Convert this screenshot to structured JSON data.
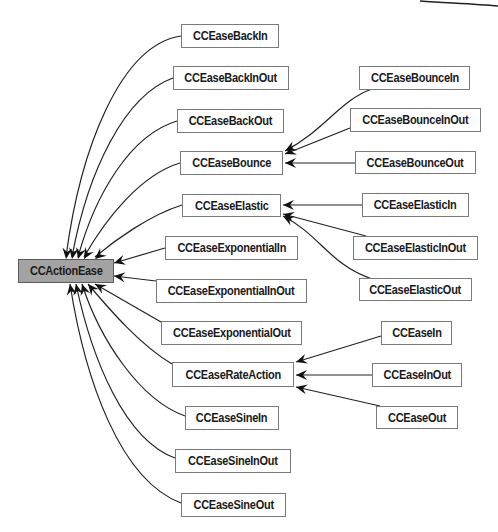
{
  "diagram": {
    "root": "CCActionEase",
    "colors": {
      "root_fill": "#a3a3a3",
      "node_fill": "#ffffff",
      "border": "#7a7a7a",
      "edge": "#222222"
    },
    "nodes": [
      {
        "id": "CCActionEase",
        "label": "CCActionEase",
        "x": 18,
        "y": 259,
        "w": 96,
        "h": 24,
        "root": true
      },
      {
        "id": "CCEaseBackIn",
        "label": "CCEaseBackIn",
        "x": 181,
        "y": 24,
        "w": 98,
        "h": 24
      },
      {
        "id": "CCEaseBackInOut",
        "label": "CCEaseBackInOut",
        "x": 173,
        "y": 66,
        "w": 116,
        "h": 24
      },
      {
        "id": "CCEaseBackOut",
        "label": "CCEaseBackOut",
        "x": 177,
        "y": 109,
        "w": 107,
        "h": 24
      },
      {
        "id": "CCEaseBounce",
        "label": "CCEaseBounce",
        "x": 180,
        "y": 151,
        "w": 103,
        "h": 24
      },
      {
        "id": "CCEaseElastic",
        "label": "CCEaseElastic",
        "x": 182,
        "y": 194,
        "w": 99,
        "h": 23
      },
      {
        "id": "CCEaseExponentialIn",
        "label": "CCEaseExponentialIn",
        "x": 165,
        "y": 236,
        "w": 133,
        "h": 24
      },
      {
        "id": "CCEaseExponentialInOut",
        "label": "CCEaseExponentialInOut",
        "x": 156,
        "y": 279,
        "w": 151,
        "h": 24
      },
      {
        "id": "CCEaseExponentialOut",
        "label": "CCEaseExponentialOut",
        "x": 161,
        "y": 321,
        "w": 141,
        "h": 24
      },
      {
        "id": "CCEaseRateAction",
        "label": "CCEaseRateAction",
        "x": 172,
        "y": 362,
        "w": 122,
        "h": 25
      },
      {
        "id": "CCEaseSineIn",
        "label": "CCEaseSineIn",
        "x": 185,
        "y": 406,
        "w": 94,
        "h": 24
      },
      {
        "id": "CCEaseSineInOut",
        "label": "CCEaseSineInOut",
        "x": 175,
        "y": 449,
        "w": 116,
        "h": 24
      },
      {
        "id": "CCEaseSineOut",
        "label": "CCEaseSineOut",
        "x": 181,
        "y": 493,
        "w": 105,
        "h": 24
      },
      {
        "id": "CCEaseBounceIn",
        "label": "CCEaseBounceIn",
        "x": 359,
        "y": 66,
        "w": 111,
        "h": 24
      },
      {
        "id": "CCEaseBounceInOut",
        "label": "CCEaseBounceInOut",
        "x": 350,
        "y": 108,
        "w": 131,
        "h": 24
      },
      {
        "id": "CCEaseBounceOut",
        "label": "CCEaseBounceOut",
        "x": 355,
        "y": 151,
        "w": 121,
        "h": 23
      },
      {
        "id": "CCEaseElasticIn",
        "label": "CCEaseElasticIn",
        "x": 362,
        "y": 193,
        "w": 107,
        "h": 24
      },
      {
        "id": "CCEaseElasticInOut",
        "label": "CCEaseElasticInOut",
        "x": 353,
        "y": 236,
        "w": 125,
        "h": 24
      },
      {
        "id": "CCEaseElasticOut",
        "label": "CCEaseElasticOut",
        "x": 359,
        "y": 278,
        "w": 113,
        "h": 23
      },
      {
        "id": "CCEaseIn",
        "label": "CCEaseIn",
        "x": 381,
        "y": 321,
        "w": 71,
        "h": 24
      },
      {
        "id": "CCEaseInOut",
        "label": "CCEaseInOut",
        "x": 372,
        "y": 363,
        "w": 90,
        "h": 24
      },
      {
        "id": "CCEaseOut",
        "label": "CCEaseOut",
        "x": 376,
        "y": 406,
        "w": 82,
        "h": 23
      }
    ],
    "edges": [
      {
        "from": "CCEaseBackIn",
        "to": "CCActionEase",
        "d": "M181,36 C120,45 80,150 66,257",
        "tip": [
          66,
          259
        ]
      },
      {
        "from": "CCEaseBackInOut",
        "to": "CCActionEase",
        "d": "M173,78 C125,95 88,170 72,257",
        "tip": [
          72,
          259
        ]
      },
      {
        "from": "CCEaseBackOut",
        "to": "CCActionEase",
        "d": "M177,121 C130,135 95,195 78,257",
        "tip": [
          78,
          259
        ]
      },
      {
        "from": "CCEaseBounce",
        "to": "CCActionEase",
        "d": "M180,163 C140,175 105,220 84,257",
        "tip": [
          84,
          259
        ]
      },
      {
        "from": "CCEaseElastic",
        "to": "CCActionEase",
        "d": "M182,205 C150,215 115,240 95,257",
        "tip": [
          95,
          259
        ]
      },
      {
        "from": "CCEaseExponentialIn",
        "to": "CCActionEase",
        "d": "M165,248 L114,263",
        "tip": [
          114,
          263
        ]
      },
      {
        "from": "CCEaseExponentialInOut",
        "to": "CCActionEase",
        "d": "M156,281 L114,276",
        "tip": [
          114,
          276
        ]
      },
      {
        "from": "CCEaseExponentialOut",
        "to": "CCActionEase",
        "d": "M161,322 L95,284",
        "tip": [
          95,
          284
        ]
      },
      {
        "from": "CCEaseRateAction",
        "to": "CCActionEase",
        "d": "M172,364 C140,345 110,310 88,284",
        "tip": [
          88,
          284
        ]
      },
      {
        "from": "CCEaseSineIn",
        "to": "CCActionEase",
        "d": "M185,416 C140,400 100,340 82,284",
        "tip": [
          82,
          284
        ]
      },
      {
        "from": "CCEaseSineInOut",
        "to": "CCActionEase",
        "d": "M175,458 C125,440 92,360 76,284",
        "tip": [
          76,
          284
        ]
      },
      {
        "from": "CCEaseSineOut",
        "to": "CCActionEase",
        "d": "M181,503 C120,480 85,380 70,284",
        "tip": [
          70,
          284
        ]
      },
      {
        "from": "CCEaseBounceIn",
        "to": "CCEaseBounce",
        "d": "M372,89 C340,100 325,130 285,151",
        "tip": [
          285,
          151
        ]
      },
      {
        "from": "CCEaseBounceInOut",
        "to": "CCEaseBounce",
        "d": "M350,128 L285,154",
        "tip": [
          285,
          154
        ]
      },
      {
        "from": "CCEaseBounceOut",
        "to": "CCEaseBounce",
        "d": "M355,163 L285,163",
        "tip": [
          285,
          163
        ]
      },
      {
        "from": "CCEaseElasticIn",
        "to": "CCEaseElastic",
        "d": "M362,205 L283,205",
        "tip": [
          283,
          205
        ]
      },
      {
        "from": "CCEaseElasticInOut",
        "to": "CCEaseElastic",
        "d": "M366,236 L283,214",
        "tip": [
          283,
          214
        ]
      },
      {
        "from": "CCEaseElasticOut",
        "to": "CCEaseElastic",
        "d": "M372,279 C330,265 320,235 283,216",
        "tip": [
          283,
          216
        ]
      },
      {
        "from": "CCEaseIn",
        "to": "CCEaseRateAction",
        "d": "M381,336 L296,362",
        "tip": [
          296,
          362
        ]
      },
      {
        "from": "CCEaseInOut",
        "to": "CCEaseRateAction",
        "d": "M372,375 L296,375",
        "tip": [
          296,
          375
        ]
      },
      {
        "from": "CCEaseOut",
        "to": "CCEaseRateAction",
        "d": "M380,406 L296,387",
        "tip": [
          296,
          387
        ]
      }
    ],
    "fragment": {
      "d": "M420,1 C450,3 475,4 498,6"
    }
  }
}
